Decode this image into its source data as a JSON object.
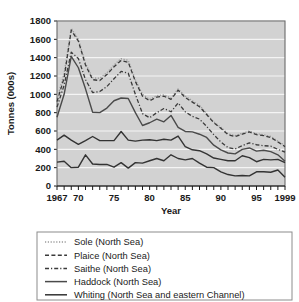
{
  "chart_data": {
    "type": "line",
    "title": "",
    "xlabel": "Year",
    "ylabel": "Tonnes (000s)",
    "xlim": [
      1967,
      1999
    ],
    "ylim": [
      0,
      1800
    ],
    "ytick_step": 200,
    "grid": true,
    "legend_position": "below",
    "background_color": "#d2d2d2",
    "gridline_color": "#f4f4f4",
    "x": [
      1967,
      1968,
      1969,
      1970,
      1971,
      1972,
      1973,
      1974,
      1975,
      1976,
      1977,
      1978,
      1979,
      1980,
      1981,
      1982,
      1983,
      1984,
      1985,
      1986,
      1987,
      1988,
      1989,
      1990,
      1991,
      1992,
      1993,
      1994,
      1995,
      1996,
      1997,
      1998,
      1999
    ],
    "xticklabels": [
      "1967",
      "70",
      "75",
      "80",
      "85",
      "90",
      "95",
      "1999"
    ],
    "xticklabel_years": [
      1967,
      1970,
      1975,
      1980,
      1985,
      1990,
      1995,
      1999
    ],
    "yticklabels": [
      "0",
      "200",
      "400",
      "600",
      "800",
      "1000",
      "1200",
      "1400",
      "1600",
      "1800"
    ],
    "series": [
      {
        "name": "Sole (North Sea)",
        "style": "dotted",
        "color": "#9a9a9a",
        "width": 1.3,
        "values": [
          950,
          1230,
          1720,
          1600,
          1340,
          1180,
          1175,
          1235,
          1320,
          1390,
          1370,
          1160,
          1000,
          945,
          985,
          995,
          960,
          1060,
          980,
          930,
          880,
          790,
          700,
          640,
          570,
          550,
          575,
          600,
          570,
          560,
          540,
          490,
          440
        ]
      },
      {
        "name": "Plaice (North Sea)",
        "style": "dashed",
        "color": "#3a3a3a",
        "width": 1.3,
        "values": [
          920,
          1180,
          1700,
          1580,
          1320,
          1160,
          1150,
          1215,
          1300,
          1370,
          1350,
          1140,
          980,
          930,
          970,
          980,
          945,
          1045,
          965,
          915,
          865,
          780,
          690,
          630,
          560,
          540,
          565,
          590,
          560,
          550,
          530,
          480,
          430
        ]
      },
      {
        "name": "Saithe (North Sea)",
        "style": "dashdot",
        "color": "#3a3a3a",
        "width": 1.3,
        "values": [
          860,
          1100,
          1460,
          1390,
          1160,
          1020,
          1030,
          1085,
          1170,
          1250,
          1230,
          1000,
          790,
          745,
          800,
          845,
          810,
          905,
          810,
          760,
          730,
          650,
          560,
          480,
          420,
          405,
          440,
          470,
          450,
          440,
          435,
          400,
          370
        ]
      },
      {
        "name": "Haddock (North Sea)",
        "style": "solid",
        "color": "#4a4a4a",
        "width": 1.4,
        "values": [
          750,
          1000,
          1415,
          1290,
          1060,
          805,
          800,
          850,
          930,
          960,
          955,
          800,
          660,
          690,
          730,
          700,
          770,
          640,
          595,
          590,
          565,
          530,
          445,
          395,
          360,
          350,
          400,
          415,
          380,
          390,
          375,
          340,
          270
        ]
      },
      {
        "name": "Whiting (North Sea and eastern Channel)",
        "style": "solid",
        "color": "#333333",
        "width": 1.4,
        "values": [
          500,
          555,
          500,
          455,
          495,
          540,
          495,
          495,
          495,
          595,
          500,
          490,
          500,
          505,
          495,
          510,
          500,
          545,
          430,
          395,
          385,
          350,
          305,
          290,
          275,
          275,
          330,
          310,
          265,
          290,
          285,
          290,
          255
        ]
      },
      {
        "name": "Whiting-lower",
        "style": "solid",
        "color": "#333333",
        "width": 1.4,
        "values": [
          260,
          270,
          200,
          205,
          340,
          240,
          235,
          235,
          205,
          255,
          195,
          255,
          250,
          275,
          300,
          275,
          340,
          300,
          285,
          300,
          250,
          205,
          200,
          155,
          125,
          110,
          115,
          110,
          155,
          155,
          150,
          175,
          95
        ]
      }
    ],
    "legend_entries": [
      {
        "label": "Sole (North Sea)",
        "style": "dotted",
        "color": "#9a9a9a"
      },
      {
        "label": "Plaice (North Sea)",
        "style": "dashed",
        "color": "#3a3a3a"
      },
      {
        "label": "Saithe (North Sea)",
        "style": "dashdot",
        "color": "#3a3a3a"
      },
      {
        "label": "Haddock (North Sea)",
        "style": "solid",
        "color": "#4a4a4a"
      },
      {
        "label": "Whiting (North Sea and eastern Channel)",
        "style": "solid",
        "color": "#333333"
      }
    ]
  }
}
